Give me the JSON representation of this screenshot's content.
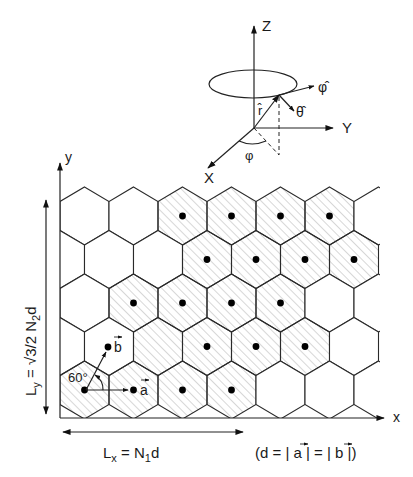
{
  "figure": {
    "type": "hexagonal-lattice-diagram",
    "coordinate_system": {
      "axes": [
        "Z",
        "Y",
        "X"
      ],
      "unit_vectors": [
        "r̂",
        "θ̂",
        "φ̂"
      ],
      "angle_label": "φ"
    },
    "lattice_axes": {
      "x_label": "x",
      "y_label": "y"
    },
    "basis_vectors": {
      "a": "a",
      "b": "b",
      "angle": "60°"
    },
    "dimensions": {
      "ly_prefix": "L",
      "ly_sub": "y",
      "ly_eq": " = √3/2  N",
      "ly_sub2": "2",
      "ly_suffix": "d",
      "lx_prefix": "L",
      "lx_sub": "x",
      "lx_eq": " =  N",
      "lx_sub2": "1",
      "lx_suffix": "d",
      "d_definition": "(d = | a | = | b |)"
    },
    "grid": {
      "rows": 5,
      "spacing_px": 49,
      "row_spacing_px": 43.5,
      "origin_x": 84.5,
      "top_center_y": 216,
      "shaded_cells": [
        {
          "row": 0,
          "cols": [
            2,
            3,
            4,
            5
          ],
          "dots": [
            2,
            3,
            4,
            5
          ]
        },
        {
          "row": 1,
          "cols": [
            3,
            4,
            5,
            6
          ],
          "dots": [
            3,
            4,
            5,
            6
          ]
        },
        {
          "row": 2,
          "cols": [
            1,
            2,
            3,
            4
          ],
          "dots": [
            1,
            2,
            3,
            4
          ]
        },
        {
          "row": 3,
          "cols": [
            2,
            3,
            4,
            5
          ],
          "dots": [
            3,
            4,
            5
          ]
        },
        {
          "row": 4,
          "cols": [
            0,
            1,
            2,
            3
          ],
          "dots": [
            0,
            1,
            2,
            3
          ]
        }
      ]
    },
    "colors": {
      "line": "#222222",
      "hatch": "#9a9a9a",
      "dot": "#000000"
    }
  }
}
